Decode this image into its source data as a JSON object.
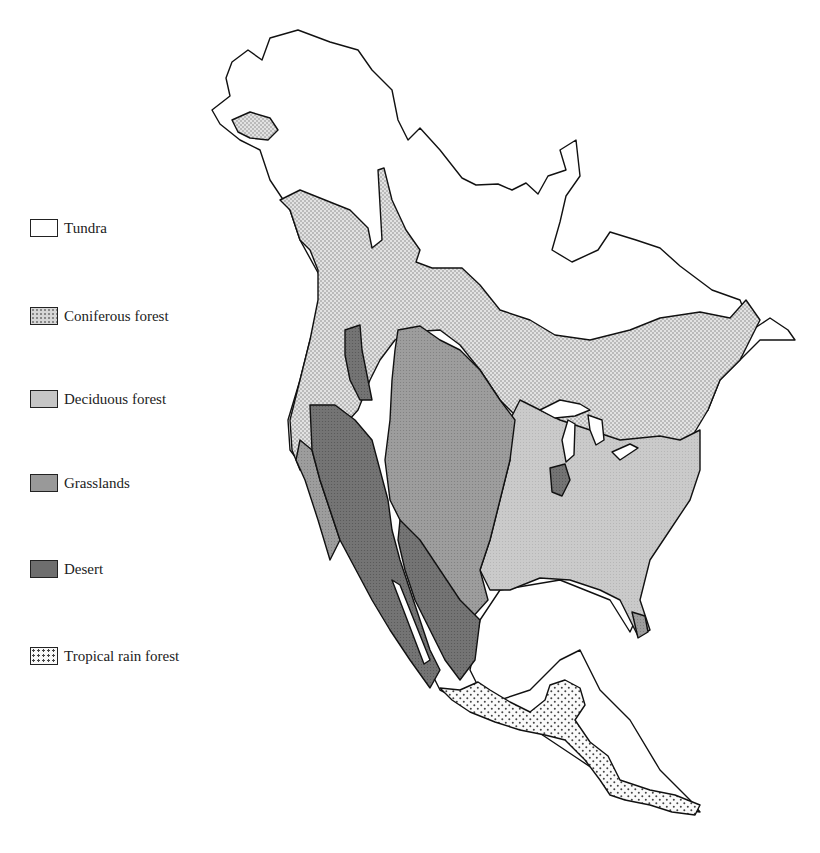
{
  "map": {
    "title": "Biomes of North America",
    "legend": [
      {
        "key": "tundra",
        "label": "Tundra",
        "fill": "#ffffff",
        "pattern": "none",
        "top": 219
      },
      {
        "key": "coniferous",
        "label": "Coniferous forest",
        "fill": "#d9d9d9",
        "pattern": "fine-dots",
        "top": 307
      },
      {
        "key": "deciduous",
        "label": "Deciduous forest",
        "fill": "#c6c6c6",
        "pattern": "none",
        "top": 390
      },
      {
        "key": "grasslands",
        "label": "Grasslands",
        "fill": "#999999",
        "pattern": "none",
        "top": 474
      },
      {
        "key": "desert",
        "label": "Desert",
        "fill": "#6e6e6e",
        "pattern": "none",
        "top": 560
      },
      {
        "key": "tropical",
        "label": "Tropical rain forest",
        "fill": "#f2f2f2",
        "pattern": "coarse-dots",
        "top": 647
      }
    ]
  }
}
